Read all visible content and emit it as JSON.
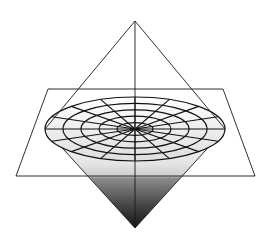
{
  "diagram": {
    "width": 268,
    "height": 239,
    "colors": {
      "background": "#ffffff",
      "stroke": "#1a1a1a",
      "grid_stroke": "#111111",
      "shade_light": "#ffffff",
      "shade_mid": "#cfcfcf",
      "shade_dark": "#141414"
    },
    "apex": {
      "x": 135,
      "y": 21
    },
    "bottom_vertex": {
      "x": 135,
      "y": 228
    },
    "ellipse": {
      "cx": 135,
      "cy": 129,
      "rx": 90,
      "ry": 32
    },
    "grid": {
      "rings": 5,
      "spokes": 16
    },
    "plane": {
      "top_left": {
        "x": 48,
        "y": 89
      },
      "top_right": {
        "x": 223,
        "y": 89
      },
      "bottom_right": {
        "x": 255,
        "y": 176
      },
      "bottom_left": {
        "x": 16,
        "y": 176
      }
    }
  }
}
